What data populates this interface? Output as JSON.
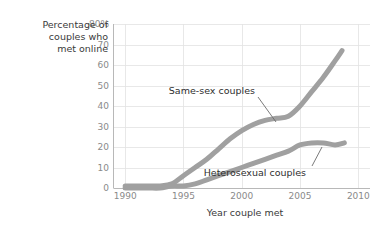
{
  "chart_data": {
    "type": "line",
    "title": "",
    "xlabel": "Year couple met",
    "ylabel": "Percentage of couples who met online",
    "ylabel_lines": [
      "Percentage of",
      "couples who",
      "met online"
    ],
    "xlim": [
      1989,
      2011
    ],
    "ylim": [
      0,
      80
    ],
    "xticks": [
      1990,
      1995,
      2000,
      2005,
      2010
    ],
    "xtick_labels": [
      "1990",
      "1995",
      "2000",
      "2005",
      "2010"
    ],
    "yticks": [
      0,
      10,
      20,
      30,
      40,
      50,
      60,
      70,
      80
    ],
    "ytick_labels": [
      "0",
      "10",
      "20",
      "30",
      "40",
      "50",
      "60",
      "70",
      "80%"
    ],
    "grid": true,
    "legend": "inline-annotations",
    "series_color": "#a0a0a0",
    "series": [
      {
        "name": "Same-sex couples",
        "annotation": "Same-sex couples",
        "x": [
          1990,
          1991,
          1992,
          1993,
          1994,
          1995,
          1996,
          1997,
          1998,
          1999,
          2000,
          2001,
          2002,
          2003,
          2004,
          2005,
          2006,
          2007,
          2008,
          2008.6
        ],
        "values": [
          1,
          1,
          1,
          1,
          2,
          6,
          10,
          14,
          19,
          24,
          28,
          31,
          33,
          34,
          35,
          40,
          47,
          54,
          62,
          67
        ]
      },
      {
        "name": "Heterosexual couples",
        "annotation": "Heterosexual couples",
        "x": [
          1990,
          1991,
          1992,
          1993,
          1994,
          1995,
          1996,
          1997,
          1998,
          1999,
          2000,
          2001,
          2002,
          2003,
          2004,
          2005,
          2006,
          2007,
          2008,
          2008.8
        ],
        "values": [
          0,
          0,
          0,
          0,
          1,
          1,
          2,
          4,
          6,
          8,
          10,
          12,
          14,
          16,
          18,
          21,
          22,
          22,
          21,
          22
        ]
      }
    ],
    "annotations": [
      {
        "label": "Same-sex couples",
        "anchor_year": 2002.2,
        "anchor_value": 33
      },
      {
        "label": "Heterosexual couples",
        "anchor_year": 2006.4,
        "anchor_value": 21.5
      }
    ]
  }
}
